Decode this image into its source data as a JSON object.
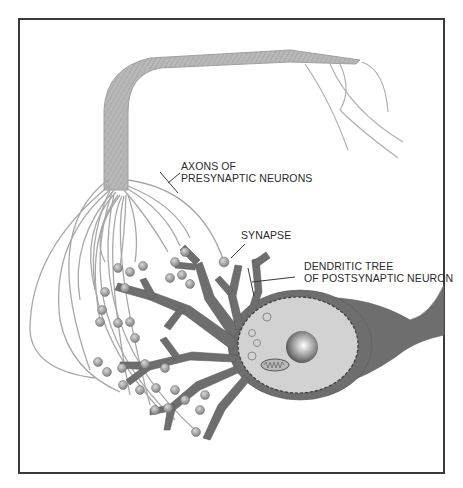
{
  "figure": {
    "type": "neuron-synapse-diagram",
    "labels": {
      "axons_line1": "AXONS OF",
      "axons_line2": "PRESYNAPTIC NEURONS",
      "synapse": "SYNAPSE",
      "dendritic_line1": "DENDRITIC TREE",
      "dendritic_line2": "OF POSTSYNAPTIC NEURON"
    },
    "colors": {
      "frame": "#3a3a3a",
      "axon_bundle": "#b4b4b4",
      "axon_fiber": "#a8a8a8",
      "dendrite": "#707070",
      "cell_body": "#6e6e6e",
      "nucleus": "#d2d2d2",
      "bouton": "#9a9a9a",
      "text": "#2a2a2a"
    }
  }
}
